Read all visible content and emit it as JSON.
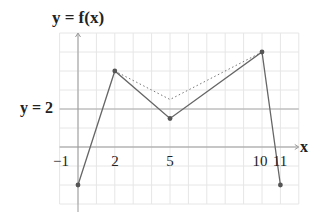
{
  "chart_data": {
    "type": "line",
    "title": "y = f(x)",
    "xlabel": "x",
    "ylabel": "y = f(x)",
    "xlim": [
      -1,
      12
    ],
    "ylim": [
      -3,
      6
    ],
    "grid": true,
    "x_tick_labels": [
      "-1",
      "2",
      "5",
      "10",
      "11"
    ],
    "x_ticks": [
      -1,
      2,
      5,
      10,
      11
    ],
    "reference_line": {
      "label": "y = 2",
      "y": 2
    },
    "series": [
      {
        "name": "f(x)",
        "style": "solid",
        "points": [
          [
            0,
            -2
          ],
          [
            2,
            4
          ],
          [
            5,
            1.5
          ],
          [
            10,
            5
          ],
          [
            11,
            -2
          ]
        ],
        "markers": true
      },
      {
        "name": "dotted",
        "style": "dotted",
        "points": [
          [
            2,
            4
          ],
          [
            5,
            2.5
          ],
          [
            10,
            5
          ]
        ],
        "markers": false
      }
    ]
  },
  "labels": {
    "title": "y = f(x)",
    "x_axis": "x",
    "ref_line": "y = 2",
    "tick_neg1": "−1",
    "tick_2": "2",
    "tick_5": "5",
    "tick_10": "10",
    "tick_11": "11"
  },
  "colors": {
    "grid": "#e6e6e6",
    "axis": "#999999",
    "line": "#666666",
    "point": "#555555",
    "ref_line": "#aaaaaa"
  }
}
